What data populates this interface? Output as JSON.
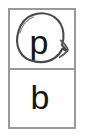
{
  "worksheet": {
    "title": "letter-choice-card",
    "frame_border_color": "#9a9a9a",
    "background_color": "#ffffff",
    "cells": [
      {
        "id": "cell-top",
        "letter": "p",
        "letter_color": "#161616",
        "annotated": "true",
        "annotation": {
          "type": "hand-drawn-circle",
          "label": "circled",
          "stroke_color": "#4a4a4a"
        }
      },
      {
        "id": "cell-bottom",
        "letter": "b",
        "letter_color": "#161616",
        "annotated": "false"
      }
    ]
  }
}
